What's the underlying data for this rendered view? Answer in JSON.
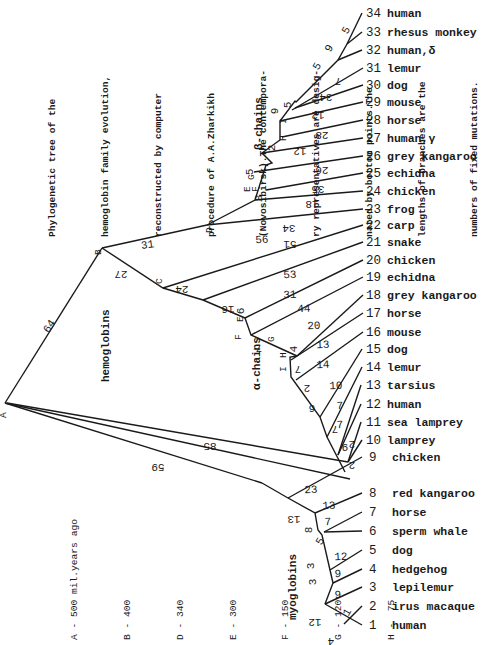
{
  "caption": {
    "lines": [
      "Phylogenetic tree of the",
      "hemoglobin family evolution,",
      "reconstructed by computer",
      "procedure of A.A.Zharkikh",
      "(Novosibirsk).The contempora-",
      "ry representatives are desig-",
      "nated by bottom points.The",
      "lengths of branches are the",
      "numbers of fixed mutations."
    ]
  },
  "legend": {
    "title": "mil.years ago",
    "entries": [
      {
        "node": "A",
        "value": "500",
        "text": "A - 500 mil.years ago"
      },
      {
        "node": "B",
        "value": "400",
        "text": "B - 400"
      },
      {
        "node": "D",
        "value": "340",
        "text": "D - 340"
      },
      {
        "node": "E",
        "value": "300",
        "text": "E - 300"
      },
      {
        "node": "F",
        "value": "150",
        "text": "F - 150"
      },
      {
        "node": "G",
        "value": "120",
        "text": "G - 120"
      },
      {
        "node": "H",
        "value": "75",
        "text": "H -  75"
      }
    ]
  },
  "groups": {
    "hemoglobins": "hemoglobins",
    "beta_chains": "β-chains",
    "alpha_chains": "α-chains",
    "myoglobins": "myoglobins"
  },
  "nodes": [
    "A",
    "B",
    "C",
    "D",
    "E",
    "F",
    "G",
    "H",
    "I"
  ],
  "leaves": [
    {
      "num": "34",
      "name": "human"
    },
    {
      "num": "33",
      "name": "rhesus monkey"
    },
    {
      "num": "32",
      "name": "human,δ"
    },
    {
      "num": "31",
      "name": "lemur"
    },
    {
      "num": "30",
      "name": "dog"
    },
    {
      "num": "29",
      "name": "mouse"
    },
    {
      "num": "28",
      "name": "horse"
    },
    {
      "num": "27",
      "name": "human,γ"
    },
    {
      "num": "26",
      "name": "grey kangaroo"
    },
    {
      "num": "25",
      "name": "echidna"
    },
    {
      "num": "24",
      "name": "chicken"
    },
    {
      "num": "23",
      "name": "frog"
    },
    {
      "num": "22",
      "name": "carp"
    },
    {
      "num": "21",
      "name": "snake"
    },
    {
      "num": "20",
      "name": "chicken"
    },
    {
      "num": "19",
      "name": "echidna"
    },
    {
      "num": "18",
      "name": "grey kangaroo"
    },
    {
      "num": "17",
      "name": "horse"
    },
    {
      "num": "16",
      "name": "mouse"
    },
    {
      "num": "15",
      "name": "dog"
    },
    {
      "num": "14",
      "name": "lemur"
    },
    {
      "num": "13",
      "name": "tarsius"
    },
    {
      "num": "12",
      "name": "human"
    },
    {
      "num": "11",
      "name": "sea lamprey"
    },
    {
      "num": "10",
      "name": "lamprey"
    },
    {
      "num": "9",
      "name": "chicken"
    },
    {
      "num": "8",
      "name": "red kangaroo"
    },
    {
      "num": "7",
      "name": "horse"
    },
    {
      "num": "6",
      "name": "sperm whale"
    },
    {
      "num": "5",
      "name": "dog"
    },
    {
      "num": "4",
      "name": "hedgehog"
    },
    {
      "num": "3",
      "name": "lepilemur"
    },
    {
      "num": "2",
      "name": "irus macaque"
    },
    {
      "num": "1",
      "name": "human"
    }
  ],
  "branch_lengths": {
    "A_B": "64",
    "A_lamprey_hi": "85",
    "A_myo": "59",
    "B_D": "31",
    "B_C": "27",
    "C_carp": "56",
    "C_E": "24",
    "snake": "53",
    "E_F": "16",
    "chicken20": "31",
    "F_int": "6",
    "echidna19": "44",
    "F_G": "7",
    "kangaroo18": "20",
    "G_horse": "13",
    "G_H": "4",
    "mouse16": "14",
    "H_I": "7",
    "dog15": "10",
    "I_2": "2",
    "lemur14": "7",
    "c6": "6",
    "tarsius13": "7",
    "c7": "7",
    "human12": "9",
    "frog23": "51",
    "chicken24": "34",
    "D_E": "8",
    "echidna25": "18",
    "kang26": "35",
    "G5": "5",
    "human27": "26",
    "H2": "2",
    "horse28": "12",
    "Hx": "1",
    "mouse29": "28",
    "I9": "9",
    "dog30": "12",
    "n5": "5",
    "lemur31": "34",
    "n5b": "5",
    "d7": "7",
    "n9": "9",
    "h5": "5",
    "sea11": "2",
    "lam10": "2",
    "chicken9": "23",
    "m13": "13",
    "kang8": "13",
    "m8": "8",
    "horse7": "7",
    "m5": "5",
    "m3": "3",
    "dog5": "12",
    "m33": "3",
    "hedge4": "9",
    "lepi3": "9",
    "m12": "12",
    "m1": "1",
    "m4": "4"
  }
}
